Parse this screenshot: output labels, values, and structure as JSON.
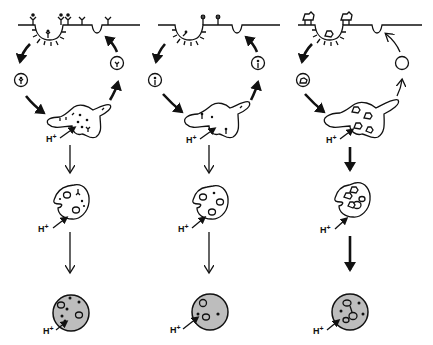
{
  "diagram": {
    "type": "endocytic-pathway-schematic",
    "panels": [
      {
        "id": "left",
        "description": "Receptor-mediated endocytosis with receptor recycling; ligand dissociates and is degraded",
        "labels": {
          "endosome_proton": "H",
          "late_endosome_proton": "H",
          "lysosome_proton": "H",
          "superscript": "+"
        },
        "arrow_weight": "thin",
        "recycle_arrow": "bold"
      },
      {
        "id": "middle",
        "description": "Receptor-ligand recycling pathway with fewer surface receptors",
        "labels": {
          "endosome_proton": "H",
          "late_endosome_proton": "H",
          "lysosome_proton": "H",
          "superscript": "+"
        },
        "arrow_weight": "thin",
        "recycle_arrow": "bold"
      },
      {
        "id": "right",
        "description": "Receptor-ligand complexes routed to lysosome; empty vesicle recycling",
        "labels": {
          "endosome_proton": "H",
          "late_endosome_proton": "H",
          "lysosome_proton": "H",
          "superscript": "+"
        },
        "arrow_weight": "bold",
        "recycle_arrow": "thin"
      }
    ],
    "proton_label": "H",
    "proton_charge": "+"
  }
}
